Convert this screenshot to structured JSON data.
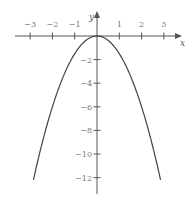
{
  "chart_data": {
    "type": "line",
    "title": "",
    "function": "y = -1.5x^2",
    "xlabel": "x",
    "ylabel": "y",
    "xlim": [
      -3.5,
      3.5
    ],
    "ylim": [
      -13,
      1
    ],
    "x_ticks": [
      -3,
      -2,
      -1,
      1,
      2,
      3
    ],
    "x_tick_labels": [
      "−3",
      "−2",
      "−1",
      "1",
      "2",
      "3"
    ],
    "y_ticks": [
      -2,
      -4,
      -6,
      -8,
      -10,
      -12
    ],
    "y_tick_labels": [
      "−2",
      "−4",
      "−6",
      "−8",
      "−10",
      "−12"
    ],
    "grid": false,
    "legend": null,
    "series": [
      {
        "name": "parabola",
        "x": [
          -2.85,
          -2.5,
          -2,
          -1.5,
          -1,
          -0.5,
          0,
          0.5,
          1,
          1.5,
          2,
          2.5,
          2.85
        ],
        "values": [
          -12.2,
          -9.4,
          -6,
          -3.4,
          -1.5,
          -0.4,
          0,
          -0.4,
          -1.5,
          -3.4,
          -6,
          -9.4,
          -12.2
        ]
      }
    ],
    "colors": {
      "axis": "#555555",
      "curve": "#444444",
      "labels": "#777777"
    }
  }
}
